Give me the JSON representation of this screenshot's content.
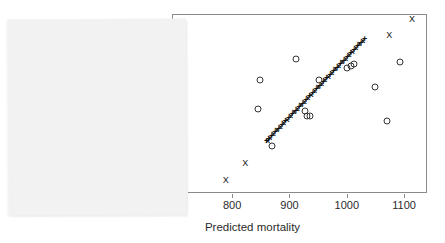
{
  "figure": {
    "kind": "scatter-plot",
    "frame_color": "#8a8a8a",
    "marker_color": "#111111"
  },
  "overlay": {
    "name": "blank-white-panel",
    "color": "#f2f2f2",
    "label": ""
  },
  "chart_data": {
    "type": "scatter",
    "title": "",
    "xlabel": "Predicted mortality",
    "ylabel": "",
    "xlim": [
      695,
      1140
    ],
    "ylim": [
      0,
      100
    ],
    "grid": false,
    "legend": "none",
    "xticks": [
      700,
      800,
      900,
      1000,
      1100
    ],
    "xticklabels": [
      "700",
      "800",
      "900",
      "1000",
      "1100"
    ],
    "first_xtick_occluded": true,
    "series": [
      {
        "name": "fitted",
        "marker": "plus",
        "x": [
          860,
          862,
          864,
          866,
          869,
          872,
          875,
          878,
          881,
          884,
          887,
          890,
          893,
          896,
          899,
          902,
          905,
          908,
          911,
          914,
          917,
          920,
          923,
          926,
          929,
          932,
          935,
          938,
          941,
          944,
          947,
          950,
          953,
          956,
          959,
          962,
          965,
          968,
          971,
          974,
          977,
          980,
          983,
          986,
          989,
          992,
          995,
          998,
          1001,
          1004,
          1007,
          1010,
          1013,
          1016,
          1019,
          1022,
          1025,
          1028,
          1031
        ],
        "y": [
          29,
          29,
          30,
          31,
          32,
          33,
          34,
          35,
          36,
          37,
          38,
          39,
          40,
          41,
          42,
          43,
          44,
          45,
          46,
          47,
          48,
          49,
          50,
          51,
          52,
          53,
          54,
          55,
          56,
          57,
          58,
          59,
          60,
          61,
          62,
          63,
          64,
          65,
          66,
          67,
          68,
          69,
          70,
          71,
          72,
          73,
          74,
          75,
          76,
          77,
          78,
          79,
          80,
          81,
          82,
          83,
          84,
          85,
          86
        ]
      },
      {
        "name": "observed",
        "marker": "circle",
        "x": [
          705,
          845,
          848,
          870,
          912,
          927,
          930,
          936,
          952,
          1000,
          1008,
          1012,
          1049,
          1071,
          1093
        ],
        "y": [
          21,
          47,
          63,
          26,
          75,
          46,
          43,
          43,
          63,
          70,
          71,
          72,
          59,
          40,
          73
        ]
      },
      {
        "name": "outliers",
        "marker": "x",
        "x": [
          789,
          823,
          1074,
          1114
        ],
        "y": [
          7,
          17,
          88,
          97
        ]
      }
    ]
  }
}
